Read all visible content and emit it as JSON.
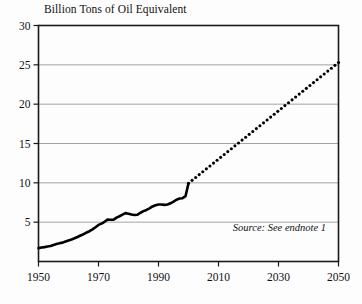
{
  "chart_data": {
    "type": "line",
    "title": "Billion Tons of Oil Equivalent",
    "xlabel": "",
    "ylabel": "",
    "xlim": [
      1950,
      2050
    ],
    "ylim": [
      0,
      30
    ],
    "grid": true,
    "grid_axis": "y",
    "legend": "none",
    "xticks": [
      1950,
      1970,
      1990,
      2010,
      2030,
      2050
    ],
    "yticks": [
      5,
      10,
      15,
      20,
      25,
      30
    ],
    "ytick_labels": [
      "5",
      "10",
      "15",
      "20",
      "25",
      "30"
    ],
    "xtick_labels": [
      "1950",
      "1970",
      "1990",
      "2010",
      "2030",
      "2050"
    ],
    "annotations": [
      {
        "text": "Source: See endnote 1",
        "style": "italic",
        "position": "bottom-right-inside-axes"
      }
    ],
    "series": [
      {
        "name": "World Energy Use (historical)",
        "style": "solid",
        "color": "#000000",
        "x": [
          1950,
          1951,
          1952,
          1953,
          1954,
          1955,
          1956,
          1957,
          1958,
          1959,
          1960,
          1961,
          1962,
          1963,
          1964,
          1965,
          1966,
          1967,
          1968,
          1969,
          1970,
          1971,
          1972,
          1973,
          1974,
          1975,
          1976,
          1977,
          1978,
          1979,
          1980,
          1981,
          1982,
          1983,
          1984,
          1985,
          1986,
          1987,
          1988,
          1989,
          1990,
          1991,
          1992,
          1993,
          1994,
          1995,
          1996,
          1997,
          1998,
          1999,
          2000
        ],
        "values": [
          1.7,
          1.78,
          1.83,
          1.9,
          1.96,
          2.1,
          2.22,
          2.31,
          2.4,
          2.55,
          2.68,
          2.8,
          2.95,
          3.12,
          3.3,
          3.47,
          3.68,
          3.85,
          4.08,
          4.35,
          4.65,
          4.82,
          5.05,
          5.32,
          5.3,
          5.3,
          5.58,
          5.75,
          5.95,
          6.15,
          6.08,
          5.98,
          5.92,
          5.95,
          6.2,
          6.4,
          6.55,
          6.75,
          7.0,
          7.15,
          7.25,
          7.25,
          7.2,
          7.25,
          7.4,
          7.6,
          7.85,
          8.0,
          8.05,
          8.3,
          9.95
        ]
      },
      {
        "name": "World Energy Use (projection)",
        "style": "dotted",
        "color": "#000000",
        "x": [
          2000,
          2050
        ],
        "values": [
          9.95,
          25.3
        ]
      }
    ]
  },
  "source_note": "Source: See endnote 1",
  "colors": {
    "line": "#000000",
    "grid": "#9a9a9a",
    "axis": "#1a1a1a",
    "background": "#fdfdfd",
    "text": "#111111"
  }
}
